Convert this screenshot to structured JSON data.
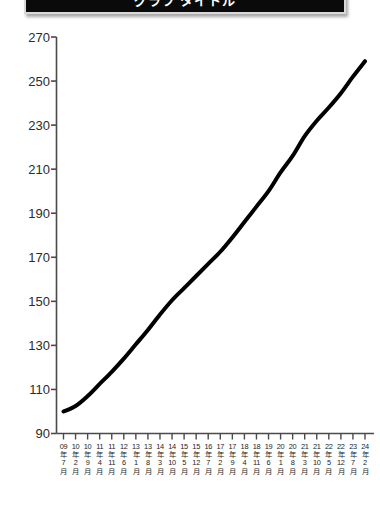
{
  "window": {
    "title": "グラフ タイトル",
    "title_visible_state": "cropped-top"
  },
  "chart_data": {
    "type": "line",
    "title": "グラフ タイトル",
    "xlabel": "",
    "ylabel": "",
    "ylim": [
      90,
      270
    ],
    "y_ticks": [
      90,
      110,
      130,
      150,
      170,
      190,
      210,
      230,
      250,
      270
    ],
    "grid": false,
    "legend": false,
    "line_color": "#000000",
    "line_width_px": 4,
    "axis_color": "#4a4a4a",
    "categories": [
      "09年7月",
      "10年2月",
      "10年9月",
      "11年4月",
      "11年11月",
      "12年6月",
      "13年1月",
      "13年8月",
      "14年3月",
      "14年10月",
      "15年5月",
      "15年12月",
      "16年7月",
      "17年2月",
      "17年9月",
      "18年4月",
      "18年11月",
      "19年6月",
      "20年1月",
      "20年8月",
      "21年3月",
      "21年10月",
      "22年5月",
      "22年12月",
      "23年7月",
      "24年2月"
    ],
    "tick_labels_parts": [
      {
        "year": "09",
        "year_kanji": "年",
        "month": "7",
        "month_kanji": "月"
      },
      {
        "year": "10",
        "year_kanji": "年",
        "month": "2",
        "month_kanji": "月"
      },
      {
        "year": "10",
        "year_kanji": "年",
        "month": "9",
        "month_kanji": "月"
      },
      {
        "year": "11",
        "year_kanji": "年",
        "month": "4",
        "month_kanji": "月"
      },
      {
        "year": "11",
        "year_kanji": "年",
        "month": "11",
        "month_kanji": "月"
      },
      {
        "year": "12",
        "year_kanji": "年",
        "month": "6",
        "month_kanji": "月"
      },
      {
        "year": "13",
        "year_kanji": "年",
        "month": "1",
        "month_kanji": "月"
      },
      {
        "year": "13",
        "year_kanji": "年",
        "month": "8",
        "month_kanji": "月"
      },
      {
        "year": "14",
        "year_kanji": "年",
        "month": "3",
        "month_kanji": "月"
      },
      {
        "year": "14",
        "year_kanji": "年",
        "month": "10",
        "month_kanji": "月"
      },
      {
        "year": "15",
        "year_kanji": "年",
        "month": "5",
        "month_kanji": "月"
      },
      {
        "year": "15",
        "year_kanji": "年",
        "month": "12",
        "month_kanji": "月"
      },
      {
        "year": "16",
        "year_kanji": "年",
        "month": "7",
        "month_kanji": "月"
      },
      {
        "year": "17",
        "year_kanji": "年",
        "month": "2",
        "month_kanji": "月"
      },
      {
        "year": "17",
        "year_kanji": "年",
        "month": "9",
        "month_kanji": "月"
      },
      {
        "year": "18",
        "year_kanji": "年",
        "month": "4",
        "month_kanji": "月"
      },
      {
        "year": "18",
        "year_kanji": "年",
        "month": "11",
        "month_kanji": "月"
      },
      {
        "year": "19",
        "year_kanji": "年",
        "month": "6",
        "month_kanji": "月"
      },
      {
        "year": "20",
        "year_kanji": "年",
        "month": "1",
        "month_kanji": "月"
      },
      {
        "year": "20",
        "year_kanji": "年",
        "month": "8",
        "month_kanji": "月"
      },
      {
        "year": "21",
        "year_kanji": "年",
        "month": "3",
        "month_kanji": "月"
      },
      {
        "year": "21",
        "year_kanji": "年",
        "month": "10",
        "month_kanji": "月"
      },
      {
        "year": "22",
        "year_kanji": "年",
        "month": "5",
        "month_kanji": "月"
      },
      {
        "year": "22",
        "year_kanji": "年",
        "month": "12",
        "month_kanji": "月"
      },
      {
        "year": "23",
        "year_kanji": "年",
        "month": "7",
        "month_kanji": "月"
      },
      {
        "year": "24",
        "year_kanji": "年",
        "month": "2",
        "month_kanji": "月"
      }
    ],
    "values": [
      100.0,
      102.5,
      107.0,
      112.5,
      118.0,
      124.0,
      130.5,
      137.0,
      144.0,
      150.5,
      156.0,
      161.5,
      167.0,
      172.5,
      179.0,
      186.0,
      193.0,
      200.0,
      208.5,
      216.0,
      225.0,
      232.0,
      238.0,
      244.5,
      252.0,
      259.0
    ],
    "series": [
      {
        "name": "系列1",
        "values": [
          100.0,
          102.5,
          107.0,
          112.5,
          118.0,
          124.0,
          130.5,
          137.0,
          144.0,
          150.5,
          156.0,
          161.5,
          167.0,
          172.5,
          179.0,
          186.0,
          193.0,
          200.0,
          208.5,
          216.0,
          225.0,
          232.0,
          238.0,
          244.5,
          252.0,
          259.0
        ]
      }
    ]
  }
}
